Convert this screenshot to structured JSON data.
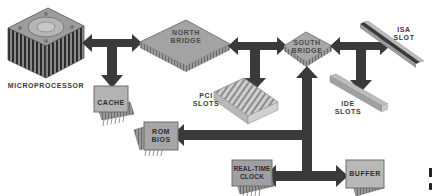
{
  "diagram": {
    "type": "computer architecture block diagram",
    "components": [
      {
        "id": "cpu",
        "label": "MICROPROCESSOR"
      },
      {
        "id": "cache",
        "label": "CACHE"
      },
      {
        "id": "northbridge",
        "label_line1": "NORTH",
        "label_line2": "BRIDGE"
      },
      {
        "id": "pci",
        "label_line1": "PCI",
        "label_line2": "SLOTS"
      },
      {
        "id": "southbridge",
        "label_line1": "SOUTH",
        "label_line2": "BRIDGE"
      },
      {
        "id": "isa",
        "label_line1": "ISA",
        "label_line2": "SLOT"
      },
      {
        "id": "ide",
        "label_line1": "IDE",
        "label_line2": "SLOTS"
      },
      {
        "id": "rombios",
        "label_line1": "ROM",
        "label_line2": "BIOS"
      },
      {
        "id": "rtc",
        "label_line1": "REAL-TIME",
        "label_line2": "CLOCK"
      },
      {
        "id": "buffer",
        "label": "BUFFER"
      }
    ],
    "connections": [
      {
        "from": "cpu",
        "to": "northbridge",
        "bidirectional": true
      },
      {
        "from": "cpu",
        "to": "cache",
        "bidirectional": false
      },
      {
        "from": "northbridge",
        "to": "southbridge",
        "bidirectional": true
      },
      {
        "from": "northbridge",
        "to": "pci",
        "bidirectional": false
      },
      {
        "from": "southbridge",
        "to": "isa",
        "bidirectional": true
      },
      {
        "from": "southbridge",
        "to": "ide",
        "bidirectional": false
      },
      {
        "from": "southbridge",
        "to": "rombios",
        "bidirectional": false
      },
      {
        "from": "rtc",
        "to": "buffer",
        "bidirectional": true
      }
    ],
    "edge_fragment": {
      "line1": "I",
      "line2": "("
    }
  },
  "colors": {
    "arrow": "#3a3a3a",
    "chip_fill": "#a8a8a8",
    "chip_border": "#6e6e6e",
    "bridge_fill": "#9e9e9e",
    "background": "#ffffff"
  }
}
